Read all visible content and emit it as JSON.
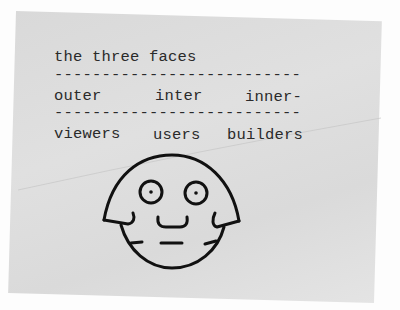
{
  "document": {
    "title": "the three faces",
    "rule": "--------------------------",
    "rule2": "--------------------------",
    "columns": [
      {
        "face": "outer",
        "role": "viewers"
      },
      {
        "face": "inter",
        "role": "users"
      },
      {
        "face": "inner-",
        "role": "builders"
      }
    ]
  },
  "illustration": {
    "subject": "hand-drawn cartoon face",
    "stroke_color": "#111111"
  },
  "colors": {
    "paper": "#dddddd",
    "background": "#fdfdfd",
    "ink": "#2a2a2a"
  }
}
